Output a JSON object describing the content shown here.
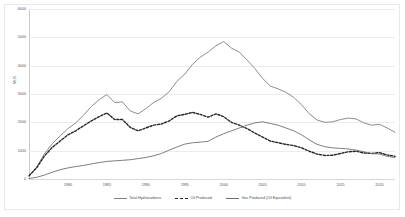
{
  "chart_data": {
    "type": "line",
    "title": "",
    "subtitle": "",
    "xlabel": "",
    "ylabel": "MLN",
    "xlim": [
      1975,
      2022
    ],
    "ylim": [
      0,
      6000
    ],
    "grid": true,
    "legend_position": "bottom",
    "yticks": [
      "6000",
      "5000",
      "4000",
      "3000",
      "2000",
      "1000",
      "0"
    ],
    "ytick_values": [
      6000,
      5000,
      4000,
      3000,
      2000,
      1000,
      0
    ],
    "xticks": [
      "1980",
      "1985",
      "1990",
      "1995",
      "2000",
      "2005",
      "2010",
      "2015",
      "2020"
    ],
    "xtick_values": [
      1980,
      1985,
      1990,
      1995,
      2000,
      2005,
      2010,
      2015,
      2020
    ],
    "x": [
      1975,
      1976,
      1977,
      1978,
      1979,
      1980,
      1981,
      1982,
      1983,
      1984,
      1985,
      1986,
      1987,
      1988,
      1989,
      1990,
      1991,
      1992,
      1993,
      1994,
      1995,
      1996,
      1997,
      1998,
      1999,
      2000,
      2001,
      2002,
      2003,
      2004,
      2005,
      2006,
      2007,
      2008,
      2009,
      2010,
      2011,
      2012,
      2013,
      2014,
      2015,
      2016,
      2017,
      2018,
      2019,
      2020,
      2021,
      2022
    ],
    "series": [
      {
        "name": "Total Hydrocarbons",
        "style": "solid",
        "color": "#808080",
        "values": [
          120,
          430,
          900,
          1250,
          1520,
          1780,
          1980,
          2250,
          2560,
          2800,
          2980,
          2700,
          2720,
          2400,
          2300,
          2480,
          2700,
          2850,
          3080,
          3450,
          3700,
          4050,
          4300,
          4480,
          4700,
          4850,
          4620,
          4480,
          4200,
          3900,
          3550,
          3280,
          3180,
          3060,
          2880,
          2620,
          2300,
          2080,
          2000,
          2020,
          2100,
          2150,
          2120,
          1980,
          1900,
          1930,
          1800,
          1650
        ]
      },
      {
        "name": "Oil Produced",
        "style": "dashed",
        "color": "#262626",
        "values": [
          110,
          400,
          820,
          1120,
          1340,
          1560,
          1700,
          1880,
          2050,
          2200,
          2330,
          2100,
          2100,
          1820,
          1700,
          1800,
          1900,
          1940,
          2050,
          2230,
          2280,
          2350,
          2280,
          2180,
          2300,
          2200,
          2000,
          1900,
          1780,
          1620,
          1480,
          1340,
          1280,
          1220,
          1180,
          1100,
          980,
          880,
          830,
          840,
          900,
          960,
          980,
          920,
          900,
          930,
          850,
          800
        ]
      },
      {
        "name": "Gas Produced (Oil Equivalent)",
        "style": "solid",
        "color": "#6f6f6f",
        "values": [
          20,
          60,
          140,
          240,
          330,
          390,
          440,
          480,
          530,
          580,
          620,
          640,
          660,
          680,
          720,
          760,
          820,
          900,
          1020,
          1130,
          1230,
          1280,
          1300,
          1330,
          1480,
          1600,
          1700,
          1800,
          1900,
          1980,
          2020,
          1960,
          1900,
          1800,
          1700,
          1560,
          1380,
          1220,
          1140,
          1100,
          1080,
          1060,
          1020,
          960,
          900,
          880,
          800,
          760
        ]
      }
    ]
  },
  "axes": {
    "ytitle": "MLN"
  },
  "legend": {
    "items": [
      {
        "label": "Total Hydrocarbons"
      },
      {
        "label": "Oil Produced"
      },
      {
        "label": "Gas Produced (Oil Equivalent)"
      }
    ]
  }
}
